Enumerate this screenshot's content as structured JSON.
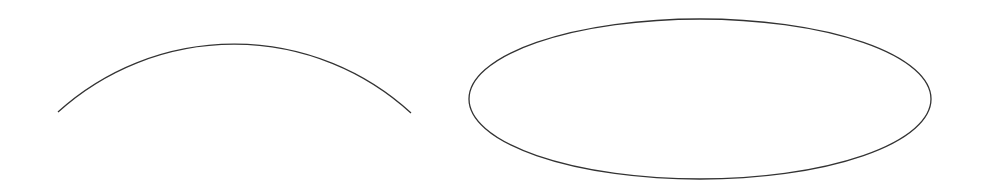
{
  "canvas": {
    "width": 987,
    "height": 191,
    "background": "#ffffff",
    "stroke_color": "#333333"
  },
  "shapes": [
    {
      "type": "arc",
      "name": "open-arc",
      "start": [
        58,
        112
      ],
      "end": [
        411,
        113
      ],
      "apex": [
        232,
        44
      ],
      "radius": 262
    },
    {
      "type": "ellipse",
      "name": "closed-ellipse",
      "center": [
        700,
        99
      ],
      "rx": 231,
      "ry": 80
    }
  ]
}
